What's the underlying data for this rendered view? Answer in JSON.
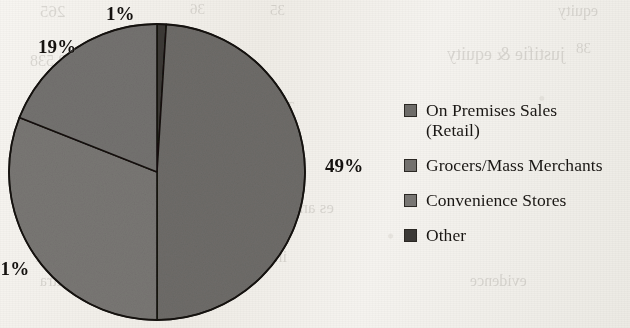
{
  "figure": {
    "kind": "pie-chart",
    "background_color": "#f2efe9",
    "scan_artifact": "mirrored bleed-through text from reverse page"
  },
  "chart_data": {
    "type": "pie",
    "title": "",
    "subtitle": "",
    "xlabel": "",
    "ylabel": "",
    "legend_position": "right",
    "grid": false,
    "units": "percent",
    "start_angle_deg": 0,
    "direction": "clockwise",
    "categories": [
      "On Premises Sales (Retail)",
      "Grocers/Mass Merchants",
      "Convenience Stores",
      "Other"
    ],
    "values": [
      49,
      19,
      31,
      1
    ],
    "slices": [
      {
        "label": "Other",
        "value": 1,
        "data_label": "1%",
        "color": "#3c3a37",
        "order": 1
      },
      {
        "label": "On Premises Sales (Retail)",
        "value": 49,
        "data_label": "49%",
        "color": "#6e6c69",
        "order": 2
      },
      {
        "label": "Convenience Stores",
        "value": 31,
        "data_label": "31%",
        "color": "#797774",
        "order": 3
      },
      {
        "label": "Grocers/Mass Merchants",
        "value": 19,
        "data_label": "19%",
        "color": "#747270",
        "order": 4
      }
    ],
    "data_labels": [
      "1%",
      "19%",
      "31%",
      "49%"
    ]
  },
  "labels": {
    "top": "1%",
    "upper_left": "19%",
    "left": "31%",
    "right": "49%"
  },
  "legend": {
    "items": [
      {
        "label": "On Premises Sales",
        "label_line2": "(Retail)",
        "color": "#6e6c69"
      },
      {
        "label": "Grocers/Mass Merchants",
        "label_line2": "",
        "color": "#73716e"
      },
      {
        "label": "Convenience Stores",
        "label_line2": "",
        "color": "#787673"
      },
      {
        "label": "Other",
        "label_line2": "",
        "color": "#3c3a37"
      }
    ]
  },
  "ghost_text": {
    "items": [
      {
        "text": "265",
        "x": 40,
        "y": 2,
        "size": 17
      },
      {
        "text": "36",
        "x": 190,
        "y": 1,
        "size": 15
      },
      {
        "text": "35",
        "x": 270,
        "y": 2,
        "size": 15
      },
      {
        "text": "equity",
        "x": 558,
        "y": 2,
        "size": 16
      },
      {
        "text": "3,538",
        "x": 30,
        "y": 52,
        "size": 16
      },
      {
        "text": "153",
        "x": 178,
        "y": 40,
        "size": 16
      },
      {
        "text": "38",
        "x": 576,
        "y": 40,
        "size": 15
      },
      {
        "text": "justifie & equity",
        "x": 447,
        "y": 44,
        "size": 18
      },
      {
        "text": "Total Liabilities & Equity",
        "x": 150,
        "y": 100,
        "size": 14
      },
      {
        "text": "es and great ability",
        "x": 205,
        "y": 198,
        "size": 17
      },
      {
        "text": "in addition to widely becoming",
        "x": 60,
        "y": 222,
        "size": 16
      },
      {
        "text": "including doing it. All we have become",
        "x": 35,
        "y": 248,
        "size": 16
      },
      {
        "text": "us as a body that discussed extra",
        "x": 40,
        "y": 272,
        "size": 16
      },
      {
        "text": "evidence",
        "x": 470,
        "y": 272,
        "size": 16
      }
    ]
  }
}
